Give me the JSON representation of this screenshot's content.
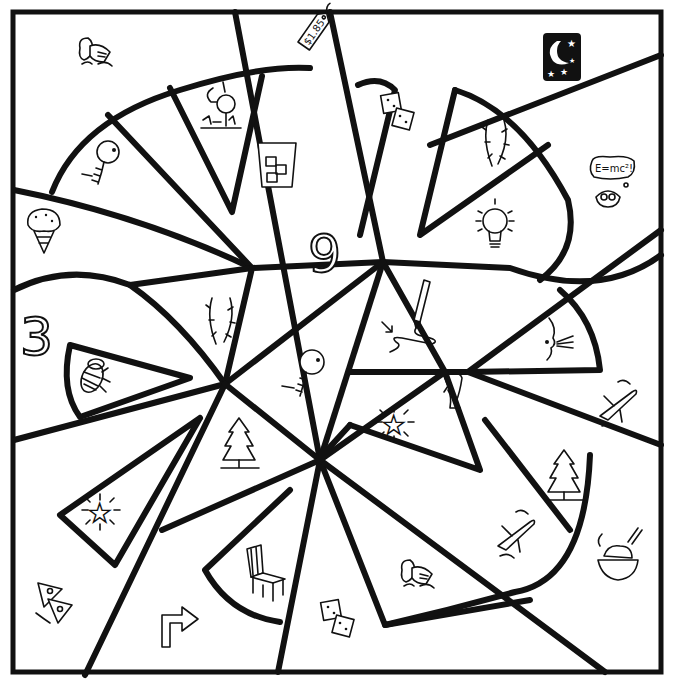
{
  "worksheet": {
    "type": "color-by-picture coloring page",
    "line_color": "#111111",
    "background_color": "#ffffff"
  },
  "numbers": [
    {
      "id": "number-nine",
      "label": "9"
    },
    {
      "id": "number-three",
      "label": "3"
    }
  ],
  "price_tag": {
    "label": "$1.85"
  },
  "thought_bubble": {
    "label": "E=mc²!"
  },
  "pictures": [
    "knight-helmet",
    "price-tag",
    "night-sky",
    "golf-ball-on-tee",
    "dice",
    "vine",
    "skeleton",
    "glass-of-ice",
    "einstein-thinker",
    "ice-cream-cone",
    "light-bulb",
    "number-9",
    "pencil-drawing",
    "vine",
    "number-3",
    "blowing-face",
    "bee",
    "skeleton",
    "leg",
    "star",
    "airplane",
    "pine-tree",
    "pine-tree",
    "star",
    "airplane",
    "bowl-of-rice",
    "chair",
    "knight-helmet",
    "pizza-slices",
    "turn-right-arrow",
    "dice"
  ]
}
